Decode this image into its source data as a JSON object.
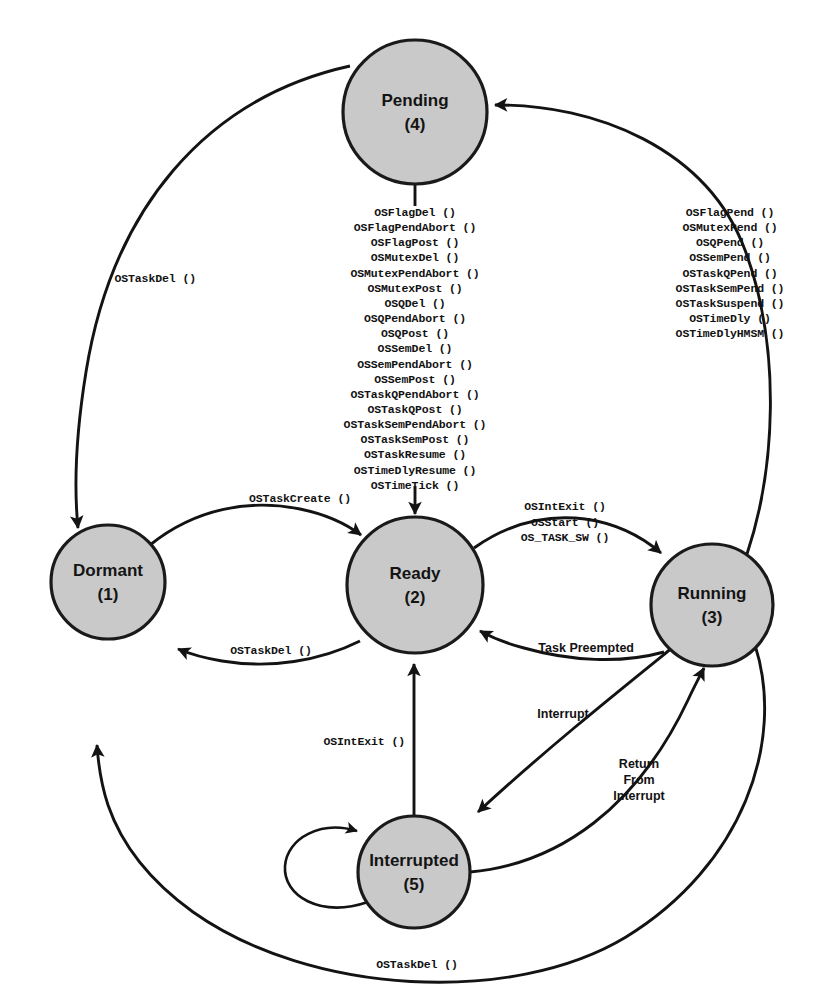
{
  "diagram": {
    "colors": {
      "state_fill": "#c9c9c9",
      "state_stroke": "#1a1a1a",
      "edge_stroke": "#131313",
      "background": "#ffffff"
    },
    "states": [
      {
        "id": "dormant",
        "label": "Dormant",
        "index": "(1)",
        "cx": 108,
        "cy": 582,
        "r": 57
      },
      {
        "id": "ready",
        "label": "Ready",
        "index": "(2)",
        "cx": 415,
        "cy": 585,
        "r": 68
      },
      {
        "id": "running",
        "label": "Running",
        "index": "(3)",
        "cx": 712,
        "cy": 605,
        "r": 61
      },
      {
        "id": "pending",
        "label": "Pending",
        "index": "(4)",
        "cx": 415,
        "cy": 112,
        "r": 72
      },
      {
        "id": "interrupted",
        "label": "Interrupted",
        "index": "(5)",
        "cx": 414,
        "cy": 872,
        "r": 56
      }
    ],
    "pending_to_ready_calls": [
      "OSFlagDel ()",
      "OSFlagPendAbort ()",
      "OSFlagPost ()",
      "OSMutexDel ()",
      "OSMutexPendAbort ()",
      "OSMutexPost ()",
      "OSQDel ()",
      "OSQPendAbort ()",
      "OSQPost ()",
      "OSSemDel ()",
      "OSSemPendAbort ()",
      "OSSemPost ()",
      "OSTaskQPendAbort ()",
      "OSTaskQPost ()",
      "OSTaskSemPendAbort ()",
      "OSTaskSemPost ()",
      "OSTaskResume ()",
      "OSTimeDlyResume ()",
      "OSTimeTick ()"
    ],
    "running_to_pending_calls": [
      "OSFlagPend ()",
      "OSMutexPend ()",
      "OSQPend ()",
      "OSSemPend ()",
      "OSTaskQPend ()",
      "OSTaskSemPend ()",
      "OSTaskSuspend ()",
      "OSTimeDly ()",
      "OSTimeDlyHMSM ()"
    ],
    "ready_to_running_calls": [
      "OSIntExit ()",
      "OSStart ()",
      "OS_TASK_SW ()"
    ],
    "edge_labels": {
      "pending_to_dormant": "OSTaskDel ()",
      "dormant_to_ready": "OSTaskCreate ()",
      "ready_to_dormant": "OSTaskDel ()",
      "running_to_dormant": "OSTaskDel ()",
      "running_to_ready": "Task Preempted",
      "interrupted_to_ready": "OSIntExit ()",
      "running_to_interrupted": "Interrupt",
      "interrupted_to_running_line1": "Return",
      "interrupted_to_running_line2": "From",
      "interrupted_to_running_line3": "Interrupt",
      "interrupted_to_interrupted": "Interrupt"
    }
  }
}
